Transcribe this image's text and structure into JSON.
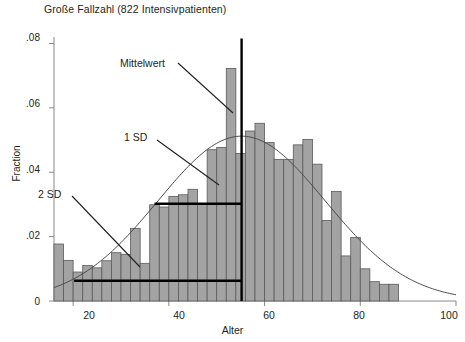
{
  "chart_data": {
    "type": "bar",
    "title": "Große Fallzahl (822 Intensivpatienten)",
    "subtitle": "",
    "xlabel": "Alter",
    "ylabel": "Fraction",
    "xlim": [
      16,
      100
    ],
    "ylim": [
      0,
      0.082
    ],
    "xticks": [
      20,
      40,
      60,
      80,
      100
    ],
    "xticklabels": [
      "20",
      "40",
      "60",
      "80",
      "100"
    ],
    "yticks": [
      0,
      0.02,
      0.04,
      0.06,
      0.08
    ],
    "yticklabels": [
      "0",
      ".02",
      ".04",
      ".06",
      ".08"
    ],
    "grid": false,
    "legend": false,
    "bar_color": "#a3a3a3",
    "bar_edge_color": "#5a5a5a",
    "curve_color": "#4a4a4a",
    "marker_color": "#000000",
    "bin_width": 2,
    "categories": [
      17,
      19,
      21,
      23,
      25,
      27,
      29,
      31,
      33,
      35,
      37,
      39,
      41,
      43,
      45,
      47,
      49,
      51,
      53,
      55,
      57,
      59,
      61,
      63,
      65,
      67,
      69,
      71,
      73,
      75,
      77,
      79,
      81,
      83,
      85,
      87
    ],
    "values": [
      0.0177,
      0.0126,
      0.009,
      0.011,
      0.0103,
      0.0125,
      0.015,
      0.0145,
      0.0225,
      0.0117,
      0.0299,
      0.0292,
      0.0325,
      0.033,
      0.0347,
      0.0303,
      0.047,
      0.0477,
      0.0722,
      0.0458,
      0.0528,
      0.0552,
      0.0492,
      0.044,
      0.044,
      0.0485,
      0.0502,
      0.0425,
      0.025,
      0.034,
      0.014,
      0.0197,
      0.01,
      0.006,
      0.0052,
      0.0052
    ],
    "normal_curve": {
      "mean": 55.2,
      "sd": 17.5,
      "peak_fraction": 0.0512,
      "x_start": 16,
      "x_end": 100
    },
    "annotations": [
      {
        "id": "mittelwert",
        "label": "Mittelwert",
        "x_value": 55.2,
        "kind": "vertical-line",
        "y_top": 0.0815,
        "y_bottom": 0.0
      },
      {
        "id": "one-sd",
        "label": "1 SD",
        "kind": "horizontal-segment",
        "y_value": 0.0302,
        "x_from": 37.0,
        "x_to": 55.2
      },
      {
        "id": "two-sd",
        "label": "2 SD",
        "kind": "horizontal-segment",
        "y_value": 0.0063,
        "x_from": 20.2,
        "x_to": 55.2
      }
    ]
  },
  "labels": {
    "title": "Große Fallzahl (822 Intensivpatienten)",
    "ylabel": "Fraction",
    "xlabel": "Alter",
    "ytick_0": "0",
    "ytick_02": ".02",
    "ytick_04": ".04",
    "ytick_06": ".06",
    "ytick_08": ".08",
    "xtick_20": "20",
    "xtick_40": "40",
    "xtick_60": "60",
    "xtick_80": "80",
    "xtick_100": "100",
    "annot_mittelwert": "Mittelwert",
    "annot_1sd": "1 SD",
    "annot_2sd": "2 SD"
  }
}
